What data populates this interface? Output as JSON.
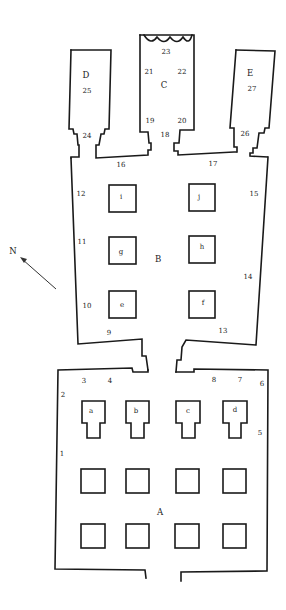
{
  "diagram": {
    "type": "cave temple floor plan",
    "colors": {
      "line": "#1a1a1a",
      "background": "#ffffff"
    },
    "compass": {
      "label": "N",
      "direction": "north-west"
    },
    "rooms": [
      {
        "id": "A",
        "label": "A"
      },
      {
        "id": "B",
        "label": "B"
      },
      {
        "id": "C",
        "label": "C"
      },
      {
        "id": "D",
        "label": "D"
      },
      {
        "id": "E",
        "label": "E"
      }
    ],
    "pillars": {
      "hall_a_shaped": [
        "a",
        "b",
        "c",
        "d"
      ],
      "hall_b": [
        "e",
        "f",
        "g",
        "h",
        "i",
        "j"
      ]
    },
    "numbers": {
      "n1": "1",
      "n2": "2",
      "n3": "3",
      "n4": "4",
      "n5": "5",
      "n6": "6",
      "n7": "7",
      "n8": "8",
      "n9": "9",
      "n10": "10",
      "n11": "11",
      "n12": "12",
      "n13": "13",
      "n14": "14",
      "n15": "15",
      "n16": "16",
      "n17": "17",
      "n18": "18",
      "n19": "19",
      "n20": "20",
      "n21": "21",
      "n22": "22",
      "n23": "23",
      "n24": "24",
      "n25": "25",
      "n26": "26",
      "n27": "27"
    }
  }
}
